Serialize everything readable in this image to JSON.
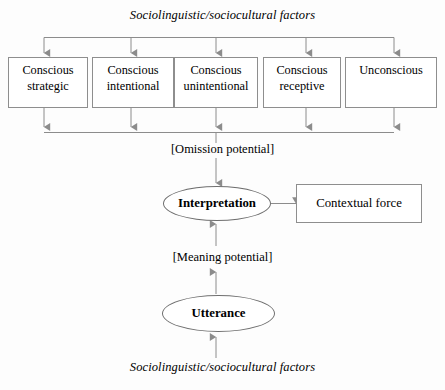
{
  "diagram": {
    "top_factors_label": "Sociolinguistic/sociocultural factors",
    "bottom_factors_label": "Sociolinguistic/sociocultural factors",
    "omission_label": "[Omission potential]",
    "meaning_label": "[Meaning potential]",
    "interpretation_label": "Interpretation",
    "utterance_label": "Utterance",
    "contextual_force_label": "Contextual force",
    "boxes": [
      {
        "line1": "Conscious",
        "line2": "strategic"
      },
      {
        "line1": "Conscious",
        "line2": "intentional"
      },
      {
        "line1": "Conscious",
        "line2": "unintentional"
      },
      {
        "line1": "Conscious",
        "line2": "receptive"
      },
      {
        "line1": "Unconscious",
        "line2": ""
      }
    ],
    "colors": {
      "background": "#fdfdfd",
      "box_border": "#8e8e8e",
      "ellipse_border": "#6f6f6f",
      "connector": "#8c8c8c",
      "text": "#000000"
    }
  }
}
